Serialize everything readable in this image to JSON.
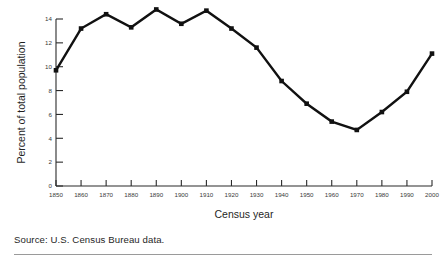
{
  "figure": {
    "source_note": "Source: U.S. Census Bureau data."
  },
  "chart_data": {
    "type": "line",
    "title": "",
    "xlabel": "Census year",
    "ylabel": "Percent of total population",
    "xlim": [
      1850,
      2000
    ],
    "ylim": [
      0,
      14
    ],
    "grid": false,
    "legend": "none",
    "marker": "square",
    "line_color": "#111111",
    "marker_color": "#111111",
    "x": [
      1850,
      1860,
      1870,
      1880,
      1890,
      1900,
      1910,
      1920,
      1930,
      1940,
      1950,
      1960,
      1970,
      1980,
      1990,
      2000
    ],
    "xticklabels": [
      "1850",
      "1860",
      "1870",
      "1880",
      "1890",
      "1900",
      "1910",
      "1920",
      "1930",
      "1940",
      "1950",
      "1960",
      "1970",
      "1980",
      "1990",
      "2000"
    ],
    "yticks": [
      0,
      2,
      4,
      6,
      8,
      10,
      12,
      14
    ],
    "yticklabels": [
      "0",
      "2",
      "4",
      "6",
      "8",
      "10",
      "12",
      "14"
    ],
    "series": [
      {
        "name": "Foreign-born percent of total population",
        "values": [
          9.7,
          13.2,
          14.4,
          13.3,
          14.8,
          13.6,
          14.7,
          13.2,
          11.6,
          8.8,
          6.9,
          5.4,
          4.7,
          6.2,
          7.9,
          11.1
        ]
      }
    ]
  }
}
